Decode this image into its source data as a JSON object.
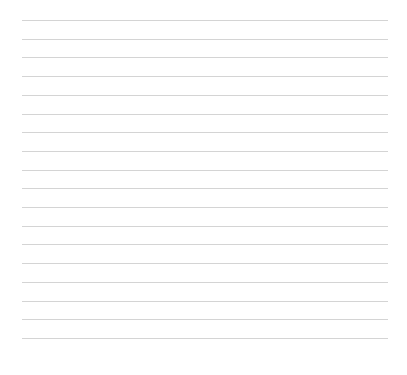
{
  "paper": {
    "type": "lined",
    "line_count": 18,
    "line_color": "#d4d4d4",
    "background": "#ffffff",
    "first_line_y": 20,
    "line_spacing": 18.7,
    "line_left": 22,
    "line_right": 388
  }
}
